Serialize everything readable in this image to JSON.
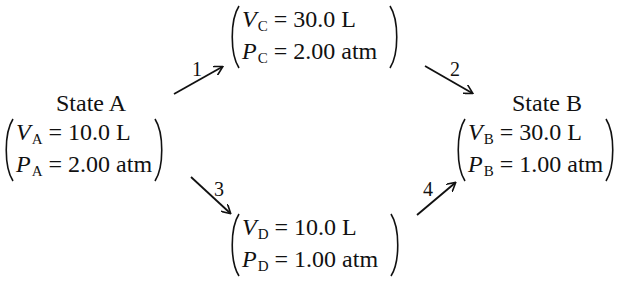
{
  "diagram": {
    "type": "thermodynamic-state-paths",
    "states": {
      "A": {
        "title": "State A",
        "volume": {
          "symbol": "V",
          "sub": "A",
          "value": "10.0 L"
        },
        "pressure": {
          "symbol": "P",
          "sub": "A",
          "value": "2.00 atm"
        }
      },
      "B": {
        "title": "State B",
        "volume": {
          "symbol": "V",
          "sub": "B",
          "value": "30.0 L"
        },
        "pressure": {
          "symbol": "P",
          "sub": "B",
          "value": "1.00 atm"
        }
      },
      "C": {
        "volume": {
          "symbol": "V",
          "sub": "C",
          "value": "30.0 L"
        },
        "pressure": {
          "symbol": "P",
          "sub": "C",
          "value": "2.00 atm"
        }
      },
      "D": {
        "volume": {
          "symbol": "V",
          "sub": "D",
          "value": "10.0 L"
        },
        "pressure": {
          "symbol": "P",
          "sub": "D",
          "value": "1.00 atm"
        }
      }
    },
    "eq": "=",
    "arrows": [
      {
        "label": "1",
        "from": "A",
        "to": "C"
      },
      {
        "label": "2",
        "from": "C",
        "to": "B"
      },
      {
        "label": "3",
        "from": "A",
        "to": "D"
      },
      {
        "label": "4",
        "from": "D",
        "to": "B"
      }
    ]
  }
}
